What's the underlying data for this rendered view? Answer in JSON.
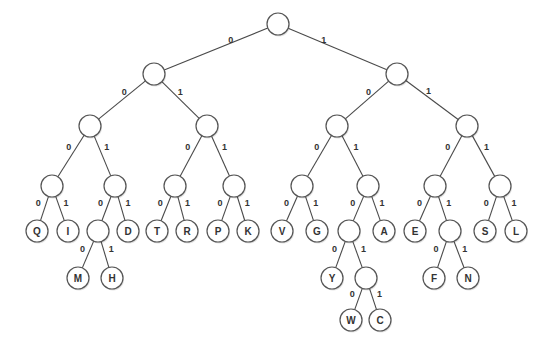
{
  "diagram": {
    "type": "binary-code-tree",
    "node_radius": 11,
    "colors": {
      "stroke": "#555555",
      "fill": "#ffffff",
      "text": "#333333"
    },
    "nodes": [
      {
        "id": "n_root",
        "x": 278,
        "y": 24,
        "label": ""
      },
      {
        "id": "n0",
        "x": 154,
        "y": 74,
        "label": ""
      },
      {
        "id": "n1",
        "x": 397,
        "y": 74,
        "label": ""
      },
      {
        "id": "n00",
        "x": 90,
        "y": 126,
        "label": ""
      },
      {
        "id": "n01",
        "x": 207,
        "y": 126,
        "label": ""
      },
      {
        "id": "n10",
        "x": 337,
        "y": 126,
        "label": ""
      },
      {
        "id": "n11",
        "x": 467,
        "y": 126,
        "label": ""
      },
      {
        "id": "n000",
        "x": 52,
        "y": 186,
        "label": ""
      },
      {
        "id": "n001",
        "x": 115,
        "y": 186,
        "label": ""
      },
      {
        "id": "n010",
        "x": 175,
        "y": 186,
        "label": ""
      },
      {
        "id": "n011",
        "x": 234,
        "y": 186,
        "label": ""
      },
      {
        "id": "n100",
        "x": 302,
        "y": 186,
        "label": ""
      },
      {
        "id": "n101",
        "x": 368,
        "y": 186,
        "label": ""
      },
      {
        "id": "n110",
        "x": 435,
        "y": 186,
        "label": ""
      },
      {
        "id": "n111",
        "x": 500,
        "y": 186,
        "label": ""
      },
      {
        "id": "Q",
        "x": 37,
        "y": 231,
        "label": "Q"
      },
      {
        "id": "I",
        "x": 68,
        "y": 231,
        "label": "I"
      },
      {
        "id": "n0010",
        "x": 98,
        "y": 231,
        "label": ""
      },
      {
        "id": "D",
        "x": 128,
        "y": 231,
        "label": "D"
      },
      {
        "id": "T",
        "x": 157,
        "y": 231,
        "label": "T"
      },
      {
        "id": "R",
        "x": 187,
        "y": 231,
        "label": "R"
      },
      {
        "id": "P",
        "x": 218,
        "y": 231,
        "label": "P"
      },
      {
        "id": "K",
        "x": 248,
        "y": 231,
        "label": "K"
      },
      {
        "id": "V",
        "x": 282,
        "y": 231,
        "label": "V"
      },
      {
        "id": "G",
        "x": 317,
        "y": 231,
        "label": "G"
      },
      {
        "id": "n1010",
        "x": 349,
        "y": 231,
        "label": ""
      },
      {
        "id": "A",
        "x": 384,
        "y": 231,
        "label": "A"
      },
      {
        "id": "E",
        "x": 415,
        "y": 231,
        "label": "E"
      },
      {
        "id": "n1101",
        "x": 450,
        "y": 231,
        "label": ""
      },
      {
        "id": "S",
        "x": 485,
        "y": 231,
        "label": "S"
      },
      {
        "id": "L",
        "x": 516,
        "y": 231,
        "label": "L"
      },
      {
        "id": "M",
        "x": 78,
        "y": 278,
        "label": "M"
      },
      {
        "id": "H",
        "x": 112,
        "y": 278,
        "label": "H"
      },
      {
        "id": "Y",
        "x": 332,
        "y": 278,
        "label": "Y"
      },
      {
        "id": "n10101",
        "x": 366,
        "y": 278,
        "label": ""
      },
      {
        "id": "F",
        "x": 434,
        "y": 278,
        "label": "F"
      },
      {
        "id": "N",
        "x": 468,
        "y": 278,
        "label": "N"
      },
      {
        "id": "W",
        "x": 351,
        "y": 320,
        "label": "W"
      },
      {
        "id": "C",
        "x": 380,
        "y": 320,
        "label": "C"
      }
    ],
    "edges": [
      {
        "from": "n_root",
        "to": "n0",
        "bit": "0"
      },
      {
        "from": "n_root",
        "to": "n1",
        "bit": "1"
      },
      {
        "from": "n0",
        "to": "n00",
        "bit": "0"
      },
      {
        "from": "n0",
        "to": "n01",
        "bit": "1"
      },
      {
        "from": "n1",
        "to": "n10",
        "bit": "0"
      },
      {
        "from": "n1",
        "to": "n11",
        "bit": "1"
      },
      {
        "from": "n00",
        "to": "n000",
        "bit": "0"
      },
      {
        "from": "n00",
        "to": "n001",
        "bit": "1"
      },
      {
        "from": "n01",
        "to": "n010",
        "bit": "0"
      },
      {
        "from": "n01",
        "to": "n011",
        "bit": "1"
      },
      {
        "from": "n10",
        "to": "n100",
        "bit": "0"
      },
      {
        "from": "n10",
        "to": "n101",
        "bit": "1"
      },
      {
        "from": "n11",
        "to": "n110",
        "bit": "0"
      },
      {
        "from": "n11",
        "to": "n111",
        "bit": "1"
      },
      {
        "from": "n000",
        "to": "Q",
        "bit": "0"
      },
      {
        "from": "n000",
        "to": "I",
        "bit": "1"
      },
      {
        "from": "n001",
        "to": "n0010",
        "bit": "0"
      },
      {
        "from": "n001",
        "to": "D",
        "bit": "1"
      },
      {
        "from": "n010",
        "to": "T",
        "bit": "0"
      },
      {
        "from": "n010",
        "to": "R",
        "bit": "1"
      },
      {
        "from": "n011",
        "to": "P",
        "bit": "0"
      },
      {
        "from": "n011",
        "to": "K",
        "bit": "1"
      },
      {
        "from": "n100",
        "to": "V",
        "bit": "0"
      },
      {
        "from": "n100",
        "to": "G",
        "bit": "1"
      },
      {
        "from": "n101",
        "to": "n1010",
        "bit": "0"
      },
      {
        "from": "n101",
        "to": "A",
        "bit": "1"
      },
      {
        "from": "n110",
        "to": "E",
        "bit": "0"
      },
      {
        "from": "n110",
        "to": "n1101",
        "bit": "1"
      },
      {
        "from": "n111",
        "to": "S",
        "bit": "0"
      },
      {
        "from": "n111",
        "to": "L",
        "bit": "1"
      },
      {
        "from": "n0010",
        "to": "M",
        "bit": "0"
      },
      {
        "from": "n0010",
        "to": "H",
        "bit": "1"
      },
      {
        "from": "n1010",
        "to": "Y",
        "bit": "0"
      },
      {
        "from": "n1010",
        "to": "n10101",
        "bit": "1"
      },
      {
        "from": "n1101",
        "to": "F",
        "bit": "0"
      },
      {
        "from": "n1101",
        "to": "N",
        "bit": "1"
      },
      {
        "from": "n10101",
        "to": "W",
        "bit": "0"
      },
      {
        "from": "n10101",
        "to": "C",
        "bit": "1"
      }
    ]
  }
}
